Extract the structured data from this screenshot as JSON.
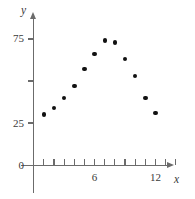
{
  "chart_data": {
    "type": "scatter",
    "title": "",
    "xlabel": "x",
    "ylabel": "y",
    "xlim": [
      0,
      14
    ],
    "ylim": [
      0,
      85
    ],
    "grid": false,
    "legend": null,
    "x_ticks": [
      {
        "value": 1,
        "label": ""
      },
      {
        "value": 2,
        "label": ""
      },
      {
        "value": 3,
        "label": ""
      },
      {
        "value": 4,
        "label": ""
      },
      {
        "value": 5,
        "label": ""
      },
      {
        "value": 6,
        "label": "6"
      },
      {
        "value": 7,
        "label": ""
      },
      {
        "value": 8,
        "label": ""
      },
      {
        "value": 9,
        "label": ""
      },
      {
        "value": 10,
        "label": ""
      },
      {
        "value": 11,
        "label": ""
      },
      {
        "value": 12,
        "label": "12"
      },
      {
        "value": 13,
        "label": ""
      },
      {
        "value": 14,
        "label": ""
      }
    ],
    "y_ticks": [
      {
        "value": 0,
        "label": "0"
      },
      {
        "value": 25,
        "label": "25"
      },
      {
        "value": 50,
        "label": ""
      },
      {
        "value": 75,
        "label": "75"
      }
    ],
    "points": [
      {
        "x": 1,
        "y": 30
      },
      {
        "x": 2,
        "y": 34
      },
      {
        "x": 3,
        "y": 40
      },
      {
        "x": 4,
        "y": 47
      },
      {
        "x": 5,
        "y": 57
      },
      {
        "x": 6,
        "y": 66
      },
      {
        "x": 7,
        "y": 74
      },
      {
        "x": 8,
        "y": 73
      },
      {
        "x": 9,
        "y": 63
      },
      {
        "x": 10,
        "y": 53
      },
      {
        "x": 11,
        "y": 40
      },
      {
        "x": 12,
        "y": 31
      }
    ],
    "colors": {
      "point": "#111111",
      "axis": "#6b6b6b",
      "label": "#3a3a3a",
      "background": "#ffffff"
    }
  }
}
